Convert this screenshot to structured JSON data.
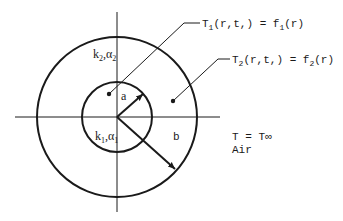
{
  "diagram": {
    "type": "composite cylinder cross-section",
    "colors": {
      "stroke": "#1a1a1a",
      "background": "#ffffff"
    },
    "regions": {
      "outer": {
        "k": "k",
        "k_sub": "2",
        "alpha": "α",
        "alpha_sub": "2"
      },
      "inner": {
        "k": "k",
        "k_sub": "1",
        "alpha": "α",
        "alpha_sub": "1"
      }
    },
    "radii": {
      "inner_label": "a",
      "outer_label": "b"
    },
    "conditions": {
      "inner": {
        "T": "T",
        "T_sub": "1",
        "args": "(r,t,) = f",
        "f_sub": "1",
        "tail": "(r)"
      },
      "outer": {
        "T": "T",
        "T_sub": "2",
        "args": "(r,t,) = f",
        "f_sub": "2",
        "tail": "(r)"
      }
    },
    "ambient": {
      "line1": "T = T∞",
      "line2": "Air"
    }
  }
}
